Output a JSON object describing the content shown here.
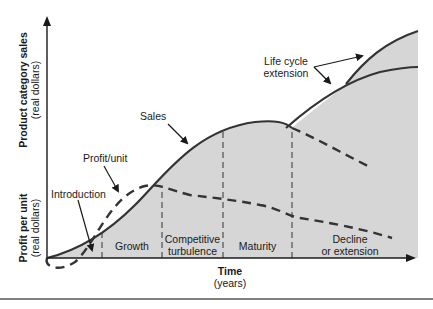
{
  "diagram": {
    "y_axis_top": {
      "line1": "Product category sales",
      "line2": "(real dollars)"
    },
    "y_axis_bottom": {
      "line1": "Profit per unit",
      "line2": "(real dollars)"
    },
    "x_axis": {
      "line1": "Time",
      "line2": "(years)"
    },
    "stages": [
      {
        "label": "Introduction"
      },
      {
        "label": "Growth"
      },
      {
        "label": "Competitive",
        "label2": "turbulence"
      },
      {
        "label": "Maturity"
      },
      {
        "label": "Decline",
        "label2": "or extension"
      }
    ],
    "annotations": {
      "sales": "Sales",
      "profit_unit": "Profit/unit",
      "life_cycle_line1": "Life cycle",
      "life_cycle_line2": "extension"
    },
    "colors": {
      "fill": "#d6d6d6",
      "line": "#333333",
      "background": "#ffffff"
    }
  }
}
